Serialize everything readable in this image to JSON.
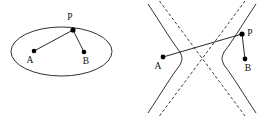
{
  "figure": {
    "background_color": "#ffffff",
    "stroke_color": "#1a1a1a",
    "point_color": "#000000",
    "panels": [
      {
        "id": "ellipse-panel",
        "type": "ellipse",
        "description": "Ellipse with foci A and B, point P on the curve, segments PA and PB drawn",
        "ellipse": {
          "cx": 61.5,
          "cy": 51.5,
          "rx": 50.5,
          "ry": 24.5,
          "rotation_deg": 0
        },
        "points": [
          {
            "name": "A",
            "label": "A",
            "x": 34,
            "y": 51,
            "label_x": 30,
            "label_y": 63,
            "role": "focus"
          },
          {
            "name": "B",
            "label": "B",
            "x": 84,
            "y": 52,
            "label_x": 86,
            "label_y": 64,
            "role": "focus"
          },
          {
            "name": "P",
            "label": "P",
            "x": 73,
            "y": 30,
            "label_x": 70,
            "label_y": 20,
            "role": "point-on-curve"
          }
        ],
        "segments": [
          {
            "name": "PA",
            "from": "P",
            "to": "A"
          },
          {
            "name": "PB",
            "from": "P",
            "to": "B"
          }
        ]
      },
      {
        "id": "hyperbola-panel",
        "type": "hyperbola",
        "description": "Hyperbola with two branches, dashed asymptotes, foci A and B, point P on right branch, segments PA and PB drawn",
        "hyperbola": {
          "cx": 202,
          "cy": 58.5,
          "a": 20,
          "b": 27,
          "asymptote_slope": 1.35,
          "asymptote_style": "dashed"
        },
        "points": [
          {
            "name": "A",
            "label": "A",
            "x": 163,
            "y": 57,
            "label_x": 158,
            "label_y": 69,
            "role": "focus"
          },
          {
            "name": "B",
            "label": "B",
            "x": 245,
            "y": 59,
            "label_x": 248,
            "label_y": 71,
            "role": "focus"
          },
          {
            "name": "P",
            "label": "P",
            "x": 242,
            "y": 34,
            "label_x": 247,
            "label_y": 36,
            "role": "point-on-curve"
          }
        ],
        "segments": [
          {
            "name": "PA",
            "from": "P",
            "to": "A"
          },
          {
            "name": "PB",
            "from": "P",
            "to": "B"
          }
        ]
      }
    ]
  }
}
